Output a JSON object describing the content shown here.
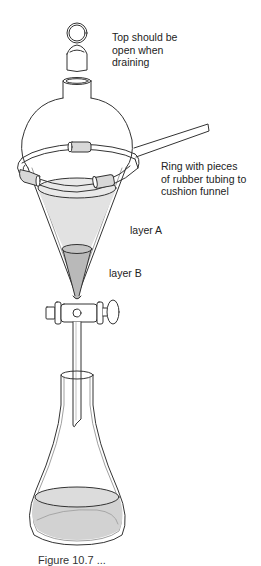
{
  "diagram": {
    "labels": {
      "top": [
        "Top should be",
        "open when",
        "draining"
      ],
      "ring": [
        "Ring with pieces",
        "of rubber tubing to",
        "cushion funnel"
      ],
      "layer_a": "layer A",
      "layer_b": "layer B"
    },
    "caption": "Figure 10.7 ...",
    "components": [
      "stopper",
      "separatory-funnel",
      "support-ring",
      "rubber-tubing",
      "stopcock",
      "stem",
      "erlenmeyer-flask"
    ],
    "colors": {
      "outline": "#333333",
      "layer_a_fill": "#e2e2e2",
      "layer_b_fill": "#b9b9b9",
      "tubing_fill": "#d8d8d8",
      "flask_liquid": "#d2d2d2"
    }
  }
}
